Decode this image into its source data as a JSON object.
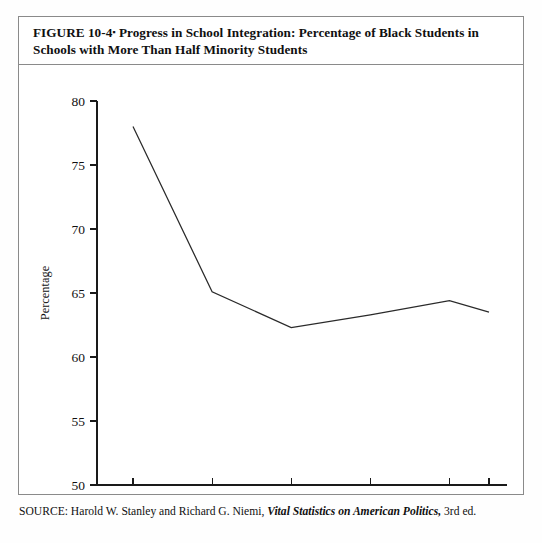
{
  "figure": {
    "title_line1": "FIGURE 10-4",
    "title_separator": "▪",
    "title_rest": "Progress in School Integration: Percentage of Black Students in Schools with More Than Half Minority Students",
    "source_prefix": "SOURCE: Harold W. Stanley and Richard G. Niemi,",
    "source_italic": "Vital Statistics on American Politics,",
    "source_suffix": "3rd ed."
  },
  "chart_data": {
    "type": "line",
    "xlabel": "",
    "ylabel": "Percentage",
    "x": [
      "1968",
      "1972",
      "1976",
      "1980",
      "1984",
      "1986"
    ],
    "values": [
      78.0,
      65.1,
      62.3,
      63.3,
      64.4,
      63.5
    ],
    "series": [
      {
        "name": "Percentage of Black Students in Schools with More Than Half Minority Students",
        "values": [
          78.0,
          65.1,
          62.3,
          63.3,
          64.4,
          63.5
        ]
      }
    ],
    "xtick_labels": [
      "1968",
      "1972",
      "1976",
      "1980",
      "1984",
      "1986"
    ],
    "ytick_labels": [
      "50",
      "55",
      "60",
      "65",
      "70",
      "75",
      "80"
    ],
    "ytick_values": [
      50,
      55,
      60,
      65,
      70,
      75,
      80
    ],
    "ylim": [
      50,
      80
    ],
    "grid": false,
    "legend": false,
    "line_color": "#2a2a2a",
    "axis_color": "#1a1a1a"
  }
}
